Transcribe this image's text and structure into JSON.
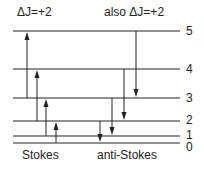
{
  "title_left": "ΔJ=+2",
  "title_right": "also ΔJ=+2",
  "caption_left": "Stokes",
  "caption_right": "anti-Stokes",
  "levels": [
    {
      "label": "0",
      "y": 143
    },
    {
      "label": "1",
      "y": 136
    },
    {
      "label": "2",
      "y": 121
    },
    {
      "label": "3",
      "y": 98
    },
    {
      "label": "4",
      "y": 69
    },
    {
      "label": "5",
      "y": 31
    }
  ],
  "stokes_transitions": [
    {
      "from": 3,
      "to": 5,
      "x": 27
    },
    {
      "from": 2,
      "to": 4,
      "x": 37
    },
    {
      "from": 1,
      "to": 3,
      "x": 46
    },
    {
      "from": 0,
      "to": 2,
      "x": 56
    }
  ],
  "anti_stokes_transitions": [
    {
      "from": 2,
      "to": 0,
      "x": 100
    },
    {
      "from": 3,
      "to": 1,
      "x": 112
    },
    {
      "from": 4,
      "to": 2,
      "x": 124
    },
    {
      "from": 5,
      "to": 3,
      "x": 136
    }
  ],
  "colors": {
    "line": "#222222",
    "background": "#ffffff"
  }
}
